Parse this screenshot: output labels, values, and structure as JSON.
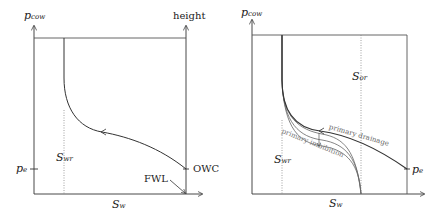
{
  "left_diagram": {
    "y_axis_label": "p",
    "y_axis_label_sub": "cow",
    "right_axis_label": "height",
    "x_axis_label": "S",
    "x_axis_label_sub": "w",
    "pe_label": "p",
    "pe_label_sub": "e",
    "swr_label": "S",
    "swr_label_sub": "wr",
    "owc_label": "OWC",
    "fwl_label": "FWL"
  },
  "right_diagram": {
    "y_axis_label": "p",
    "y_axis_label_sub": "cow",
    "x_axis_label": "S",
    "x_axis_label_sub": "w",
    "pe_label": "p",
    "pe_label_sub": "e",
    "swr_label": "S",
    "swr_label_sub": "wr",
    "sor_label": "S",
    "sor_label_sub": "or",
    "drainage_label": "primary drainage",
    "imbibition_label": "primary imbibition"
  },
  "colors": {
    "axis": "#333333",
    "curve": "#333333",
    "imbibition_curve": "#666666",
    "dotted": "#888888",
    "label_gray": "#777777"
  }
}
